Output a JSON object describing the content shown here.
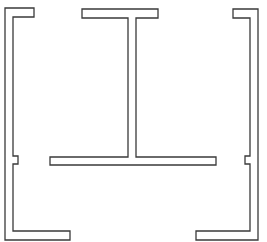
{
  "diagram": {
    "canvas": {
      "width": 267,
      "height": 242,
      "background": "#ffffff"
    },
    "stroke_color": "#3a3a3a",
    "shapes": [
      {
        "id": "left-bracket",
        "type": "outlined-polygon",
        "points": [
          [
            5,
            8
          ],
          [
            34,
            8
          ],
          [
            34,
            17
          ],
          [
            13,
            17
          ],
          [
            13,
            156
          ],
          [
            18,
            156
          ],
          [
            18,
            164
          ],
          [
            13,
            164
          ],
          [
            13,
            231
          ],
          [
            70,
            231
          ],
          [
            70,
            240
          ],
          [
            5,
            240
          ]
        ]
      },
      {
        "id": "center-t-beam",
        "type": "outlined-polygon",
        "points": [
          [
            82,
            9
          ],
          [
            158,
            9
          ],
          [
            158,
            18
          ],
          [
            136,
            18
          ],
          [
            136,
            157
          ],
          [
            216,
            157
          ],
          [
            216,
            165
          ],
          [
            50,
            165
          ],
          [
            50,
            157
          ],
          [
            128,
            157
          ],
          [
            128,
            18
          ],
          [
            82,
            18
          ]
        ]
      },
      {
        "id": "right-bracket",
        "type": "outlined-polygon",
        "points": [
          [
            233,
            9
          ],
          [
            258,
            9
          ],
          [
            258,
            240
          ],
          [
            196,
            240
          ],
          [
            196,
            231
          ],
          [
            250,
            231
          ],
          [
            250,
            164
          ],
          [
            245,
            164
          ],
          [
            245,
            156
          ],
          [
            250,
            156
          ],
          [
            250,
            18
          ],
          [
            233,
            18
          ]
        ]
      }
    ]
  }
}
